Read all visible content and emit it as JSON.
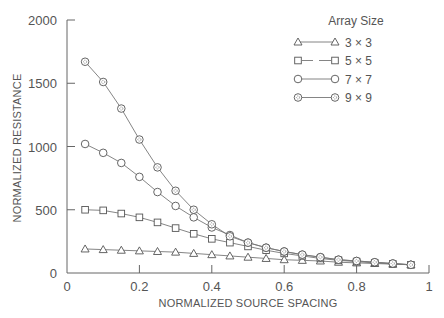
{
  "chart_data": {
    "type": "line",
    "title": "",
    "xlabel": "NORMALIZED SOURCE SPACING",
    "ylabel": "NORMALIZED RESISTANCE",
    "xlim": [
      0,
      1
    ],
    "ylim": [
      0,
      2000
    ],
    "x_ticks": [
      0,
      0.2,
      0.4,
      0.6,
      0.8,
      1
    ],
    "x_tick_labels": [
      "0",
      "0.2",
      "0.4",
      "0.6",
      "0.8",
      "1"
    ],
    "y_ticks": [
      0,
      500,
      1000,
      1500,
      2000
    ],
    "y_tick_labels": [
      "0",
      "500",
      "1000",
      "1500",
      "2000"
    ],
    "grid": false,
    "legend": {
      "title": "Array Size",
      "position": "upper right"
    },
    "x": [
      0.05,
      0.1,
      0.15,
      0.2,
      0.25,
      0.3,
      0.35,
      0.4,
      0.45,
      0.5,
      0.55,
      0.6,
      0.65,
      0.7,
      0.75,
      0.8,
      0.85,
      0.9,
      0.95
    ],
    "series": [
      {
        "name": "3 × 3",
        "marker": "triangle",
        "line": "solid",
        "values": [
          190,
          185,
          180,
          175,
          170,
          165,
          155,
          145,
          135,
          125,
          115,
          105,
          100,
          95,
          85,
          80,
          75,
          70,
          65
        ]
      },
      {
        "name": "5 × 5",
        "marker": "square",
        "line": "dashed",
        "values": [
          500,
          495,
          470,
          440,
          400,
          355,
          310,
          270,
          240,
          210,
          180,
          155,
          135,
          115,
          100,
          90,
          80,
          72,
          65
        ]
      },
      {
        "name": "7 × 7",
        "marker": "circle",
        "line": "solid",
        "values": [
          1020,
          950,
          870,
          760,
          640,
          530,
          440,
          360,
          300,
          240,
          200,
          170,
          145,
          125,
          105,
          95,
          85,
          75,
          65
        ]
      },
      {
        "name": "9 × 9",
        "marker": "circle-dotted",
        "line": "solid",
        "values": [
          1670,
          1510,
          1300,
          1055,
          835,
          650,
          500,
          385,
          290,
          240,
          200,
          170,
          145,
          125,
          105,
          95,
          85,
          75,
          65
        ]
      }
    ]
  }
}
